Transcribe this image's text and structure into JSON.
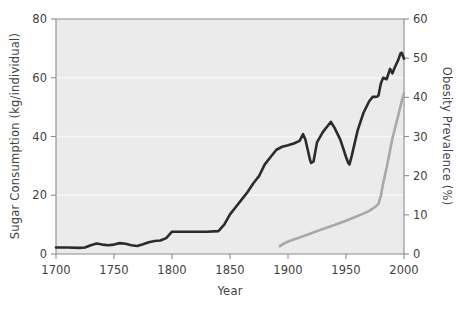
{
  "chart_data": {
    "type": "line",
    "title": "",
    "xlabel": "Year",
    "ylabel": "Sugar Consumption (kg/individual)",
    "y2label": "Obesity Prevalence (%)",
    "xlim": [
      1700,
      2000
    ],
    "ylim": [
      0,
      80
    ],
    "y2lim": [
      0,
      60
    ],
    "xticks": [
      1700,
      1750,
      1800,
      1850,
      1900,
      1950,
      2000
    ],
    "xtick_labels": [
      "1700",
      "1750",
      "1800",
      "1850",
      "1900",
      "1950",
      "2000"
    ],
    "yticks": [
      0,
      20,
      40,
      60,
      80
    ],
    "ytick_labels": [
      "0",
      "20",
      "40",
      "60",
      "80"
    ],
    "y2ticks": [
      0,
      10,
      20,
      30,
      40,
      50,
      60
    ],
    "y2tick_labels": [
      "0",
      "10",
      "20",
      "30",
      "40",
      "50",
      "60"
    ],
    "grid": "horizontal-white-faint",
    "legend": "none",
    "plot_background": "#ebebeb",
    "series": [
      {
        "name": "Sugar Consumption",
        "axis": "left",
        "color": "#2b2b2b",
        "width": 2.6,
        "units": "kg/individual",
        "x": [
          1700,
          1710,
          1720,
          1725,
          1730,
          1735,
          1740,
          1745,
          1750,
          1755,
          1760,
          1765,
          1770,
          1775,
          1780,
          1785,
          1790,
          1795,
          1800,
          1805,
          1810,
          1820,
          1830,
          1840,
          1845,
          1850,
          1855,
          1860,
          1865,
          1870,
          1872,
          1875,
          1880,
          1885,
          1890,
          1895,
          1900,
          1905,
          1910,
          1913,
          1915,
          1917,
          1919,
          1920,
          1922,
          1925,
          1930,
          1935,
          1937,
          1940,
          1945,
          1948,
          1950,
          1952,
          1953,
          1955,
          1960,
          1965,
          1970,
          1973,
          1975,
          1977,
          1978,
          1980,
          1982,
          1985,
          1988,
          1990,
          1992,
          1995,
          1997,
          1998,
          1999,
          2000
        ],
        "values": [
          2.2,
          2.2,
          2.1,
          2.2,
          3.0,
          3.6,
          3.2,
          3.0,
          3.2,
          3.7,
          3.5,
          3.0,
          2.7,
          3.3,
          4.0,
          4.4,
          4.6,
          5.4,
          7.6,
          7.6,
          7.6,
          7.6,
          7.6,
          7.8,
          10.0,
          13.5,
          16.0,
          18.5,
          21.0,
          24.0,
          25.0,
          26.5,
          30.5,
          33.0,
          35.5,
          36.5,
          37.0,
          37.6,
          38.5,
          40.8,
          39.0,
          35.5,
          32.0,
          31.0,
          31.5,
          38.0,
          41.5,
          44.0,
          45.0,
          43.0,
          39.0,
          35.5,
          33.0,
          31.0,
          30.5,
          33.5,
          42.0,
          48.0,
          52.0,
          53.5,
          53.5,
          53.6,
          54.0,
          58.0,
          60.0,
          59.5,
          63.0,
          61.5,
          63.5,
          66.0,
          68.3,
          68.5,
          67.5,
          66.5
        ]
      },
      {
        "name": "Obesity Prevalence",
        "axis": "right",
        "color": "#a8a8a8",
        "width": 2.6,
        "units": "%",
        "x": [
          1893,
          1896,
          1900,
          1905,
          1910,
          1920,
          1930,
          1940,
          1950,
          1960,
          1965,
          1970,
          1975,
          1978,
          1980,
          1982,
          1985,
          1988,
          1990,
          1993,
          1996,
          1998,
          2000
        ],
        "values": [
          2.0,
          2.6,
          3.2,
          3.7,
          4.2,
          5.3,
          6.4,
          7.4,
          8.5,
          9.7,
          10.3,
          11.0,
          12.0,
          12.8,
          14.8,
          18.0,
          22.0,
          26.5,
          29.5,
          33.0,
          36.5,
          39.0,
          41.0
        ]
      }
    ],
    "annotations": []
  }
}
